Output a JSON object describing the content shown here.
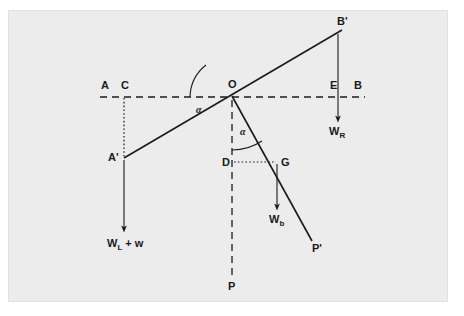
{
  "figure": {
    "background_color": "#ececec",
    "page_color": "#ffffff",
    "ink_color": "#1a1a1a",
    "points": [
      {
        "id": "A",
        "label": "A",
        "x": 100,
        "y": 97,
        "label_x": 101,
        "label_y": 89
      },
      {
        "id": "C",
        "label": "C",
        "x": 124,
        "y": 97,
        "label_x": 121,
        "label_y": 89
      },
      {
        "id": "O",
        "label": "O",
        "x": 232,
        "y": 96,
        "label_x": 228,
        "label_y": 88
      },
      {
        "id": "E",
        "label": "E",
        "x": 338,
        "y": 97,
        "label_x": 330,
        "label_y": 89
      },
      {
        "id": "B",
        "label": "B",
        "x": 360,
        "y": 97,
        "label_x": 354,
        "label_y": 89
      },
      {
        "id": "Bp",
        "label": "B'",
        "x": 340,
        "y": 32,
        "label_x": 337,
        "label_y": 25
      },
      {
        "id": "Ap",
        "label": "A'",
        "x": 124,
        "y": 158,
        "label_x": 110,
        "label_y": 161
      },
      {
        "id": "D",
        "label": "D",
        "x": 232,
        "y": 162,
        "label_x": 223,
        "label_y": 165
      },
      {
        "id": "G",
        "label": "G",
        "x": 278,
        "y": 162,
        "label_x": 281,
        "label_y": 165
      },
      {
        "id": "P",
        "label": "P",
        "x": 232,
        "y": 280,
        "label_x": 228,
        "label_y": 289
      },
      {
        "id": "Pp",
        "label": "P'",
        "x": 310,
        "y": 243,
        "label_x": 313,
        "label_y": 251
      }
    ],
    "angles": [
      {
        "id": "alpha-horizontal",
        "label": "α",
        "label_x": 196,
        "label_y": 112
      },
      {
        "id": "alpha-vertical",
        "label": "α",
        "label_x": 240,
        "label_y": 134
      }
    ],
    "forces": [
      {
        "id": "W_R",
        "base": "W",
        "subscript": "R",
        "suffix": "",
        "x": 330,
        "y": 131
      },
      {
        "id": "W_b",
        "base": "W",
        "subscript": "b",
        "suffix": "",
        "x": 270,
        "y": 219
      },
      {
        "id": "W_L_plus_w",
        "base": "W",
        "subscript": "L",
        "suffix": " + w",
        "x": 108,
        "y": 243
      }
    ],
    "lines": {
      "horizontal_dashed_AB": {
        "x1": 100,
        "y1": 97,
        "x2": 365,
        "y2": 97
      },
      "lever_ApBp": {
        "x1": 124,
        "y1": 158,
        "x2": 342,
        "y2": 30
      },
      "pendulum_OPp": {
        "x1": 232,
        "y1": 96,
        "x2": 312,
        "y2": 241
      },
      "vertical_dashed_OP": {
        "x1": 232,
        "y1": 100,
        "x2": 232,
        "y2": 276
      },
      "dotted_C_to_Ap": {
        "x1": 124,
        "y1": 97,
        "x2": 124,
        "y2": 158
      },
      "dotted_D_to_G": {
        "x1": 234,
        "y1": 162,
        "x2": 277,
        "y2": 162
      }
    },
    "arrows": [
      {
        "id": "arrow-WL",
        "x1": 124,
        "y1": 160,
        "x2": 124,
        "y2": 229
      },
      {
        "id": "arrow-WR",
        "x1": 338,
        "y1": 34,
        "x2": 338,
        "y2": 119
      },
      {
        "id": "arrow-Wb",
        "x1": 277,
        "y1": 164,
        "x2": 277,
        "y2": 207
      }
    ]
  }
}
